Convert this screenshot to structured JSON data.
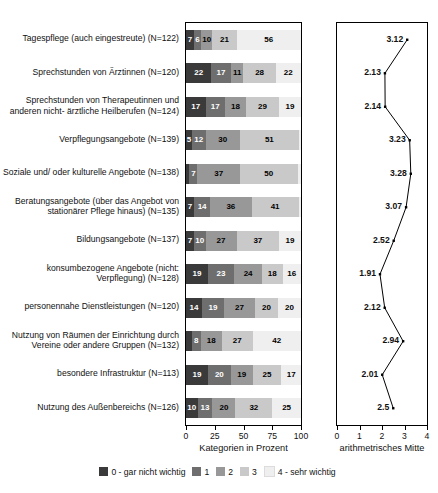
{
  "chart_data": {
    "type": "bar",
    "subtype": "stacked-horizontal-percent",
    "title": "",
    "xlabel": "Kategorien in Prozent",
    "ylabel": "",
    "xlim": [
      0,
      100
    ],
    "xticks": [
      0,
      25,
      50,
      75,
      100
    ],
    "grid": false,
    "legend_position": "bottom",
    "categories": [
      "Tagespflege (auch eingestreute) (N=122)",
      "Sprechstunden von Ärztinnen (N=120)",
      "Sprechstunden von Therapeutinnen und anderen nicht- ärztliche Heilberufen (N=124)",
      "Verpflegungsangebote (N=139)",
      "Soziale und/ oder kulturelle Angebote (N=138)",
      "Beratungsangebote (über das Angebot von stationärer Pflege hinaus) (N=135)",
      "Bildungsangebote (N=137)",
      "konsumbezogene Angebote (nicht: Verpflegung) (N=128)",
      "personennahe Dienstleistungen (N=120)",
      "Nutzung von Räumen der Einrichtung durch Vereine oder andere Gruppen (N=132)",
      "besondere Infrastruktur (N=113)",
      "Nutzung des Außenbereichs (N=126)"
    ],
    "series": [
      {
        "name": "0 - gar nicht wichtig",
        "color": "#3a3a3a",
        "values": [
          7,
          22,
          17,
          5,
          3,
          7,
          7,
          19,
          14,
          5,
          19,
          10
        ]
      },
      {
        "name": "1",
        "color": "#6e6e6e",
        "values": [
          6,
          17,
          17,
          12,
          7,
          14,
          10,
          23,
          19,
          8,
          20,
          13
        ]
      },
      {
        "name": "2",
        "color": "#989898",
        "values": [
          10,
          11,
          18,
          30,
          37,
          36,
          27,
          24,
          27,
          18,
          19,
          20
        ]
      },
      {
        "name": "3",
        "color": "#c9c9c9",
        "values": [
          21,
          28,
          29,
          51,
          50,
          41,
          37,
          18,
          20,
          27,
          25,
          32
        ]
      },
      {
        "name": "4 - sehr wichtig",
        "color": "#efefef",
        "values": [
          56,
          22,
          19,
          2,
          3,
          2,
          19,
          16,
          20,
          42,
          17,
          25
        ]
      }
    ],
    "bar_labels": [
      [
        "7",
        "6",
        "10",
        "21",
        "56"
      ],
      [
        "22",
        "17",
        "11",
        "28",
        "22"
      ],
      [
        "17",
        "17",
        "18",
        "29",
        "19"
      ],
      [
        "5",
        "12",
        "30",
        "51",
        ""
      ],
      [
        "",
        "7",
        "37",
        "50",
        ""
      ],
      [
        "7",
        "14",
        "36",
        "41",
        ""
      ],
      [
        "7",
        "10",
        "27",
        "37",
        "19"
      ],
      [
        "19",
        "23",
        "24",
        "18",
        "16"
      ],
      [
        "14",
        "19",
        "27",
        "20",
        "20"
      ],
      [
        "",
        "8",
        "18",
        "27",
        "42"
      ],
      [
        "19",
        "20",
        "19",
        "25",
        "17"
      ],
      [
        "10",
        "13",
        "20",
        "32",
        "25"
      ]
    ],
    "secondary": {
      "type": "line",
      "xlabel": "arithmetrisches Mitte",
      "xlim": [
        0,
        4
      ],
      "xticks": [
        0,
        1,
        2,
        3,
        4
      ],
      "marker": "dot",
      "values": [
        3.12,
        2.13,
        2.14,
        3.23,
        3.28,
        3.07,
        2.52,
        1.91,
        2.12,
        2.94,
        2.01,
        2.5
      ],
      "labels": [
        "3.12",
        "2.13",
        "2.14",
        "3.23",
        "3.28",
        "3.07",
        "2.52",
        "1.91",
        "2.12",
        "2.94",
        "2.01",
        "2.5"
      ]
    },
    "legend_items": [
      {
        "label": "0 - gar nicht wichtig",
        "color": "#3a3a3a"
      },
      {
        "label": "1",
        "color": "#6e6e6e"
      },
      {
        "label": "2",
        "color": "#989898"
      },
      {
        "label": "3",
        "color": "#c9c9c9"
      },
      {
        "label": "4 - sehr wichtig",
        "color": "#efefef"
      }
    ]
  }
}
